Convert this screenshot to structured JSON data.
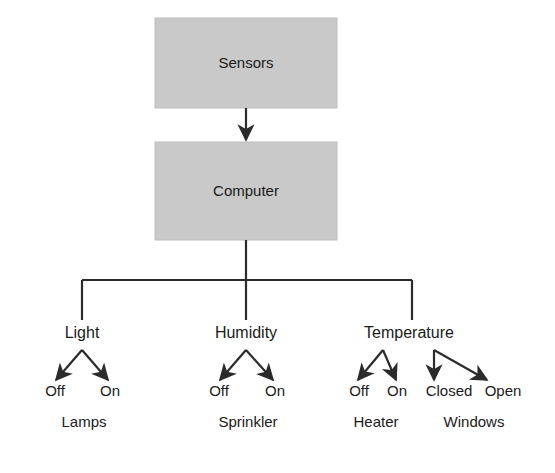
{
  "diagram": {
    "type": "flowchart",
    "background_color": "#ffffff",
    "box_fill_color": "#c9c9c9",
    "line_color": "#2b2b2b",
    "text_color": "#1a1a1a",
    "boxes": [
      {
        "id": "sensors",
        "label": "Sensors",
        "x": 155,
        "y": 18,
        "width": 182,
        "height": 90
      },
      {
        "id": "computer",
        "label": "Computer",
        "x": 155,
        "y": 142,
        "width": 182,
        "height": 98
      }
    ],
    "main_arrow": {
      "from": "sensors",
      "to": "computer",
      "x": 246,
      "y_start": 108,
      "y_end": 140
    },
    "bus": {
      "stem_x": 246,
      "stem_y_start": 240,
      "bus_y": 280,
      "left_x": 82,
      "right_x": 412,
      "drop_y_end": 320
    },
    "branches": [
      {
        "id": "light",
        "label": "Light",
        "label_x": 82,
        "label_y": 338,
        "apex_x": 82,
        "apex_y": 350,
        "states": [
          {
            "label": "Off",
            "x": 55,
            "y": 396
          },
          {
            "label": "On",
            "x": 110,
            "y": 396
          }
        ],
        "devices": [
          {
            "label": "Lamps",
            "x": 84,
            "y": 427
          }
        ]
      },
      {
        "id": "humidity",
        "label": "Humidity",
        "label_x": 246,
        "label_y": 338,
        "apex_x": 246,
        "apex_y": 350,
        "states": [
          {
            "label": "Off",
            "x": 219,
            "y": 396
          },
          {
            "label": "On",
            "x": 275,
            "y": 396
          }
        ],
        "devices": [
          {
            "label": "Sprinkler",
            "x": 248,
            "y": 427
          }
        ]
      },
      {
        "id": "temperature",
        "label": "Temperature",
        "label_x": 409,
        "label_y": 338,
        "apex_x": 409,
        "apex_y": 350,
        "states": [
          {
            "label": "Off",
            "x": 359,
            "y": 396
          },
          {
            "label": "On",
            "x": 397,
            "y": 396
          },
          {
            "label": "Closed",
            "x": 449,
            "y": 396
          },
          {
            "label": "Open",
            "x": 503,
            "y": 396
          }
        ],
        "devices": [
          {
            "label": "Heater",
            "x": 376,
            "y": 427
          },
          {
            "label": "Windows",
            "x": 474,
            "y": 427
          }
        ]
      }
    ],
    "branch_arrows": [
      {
        "branch": "light",
        "x1": 82,
        "y1": 350,
        "x2": 56,
        "y2": 380
      },
      {
        "branch": "light",
        "x1": 82,
        "y1": 350,
        "x2": 108,
        "y2": 380
      },
      {
        "branch": "humidity",
        "x1": 246,
        "y1": 350,
        "x2": 220,
        "y2": 380
      },
      {
        "branch": "humidity",
        "x1": 246,
        "y1": 350,
        "x2": 273,
        "y2": 380
      },
      {
        "branch": "temperature",
        "x1": 383,
        "y1": 350,
        "x2": 358,
        "y2": 380
      },
      {
        "branch": "temperature",
        "x1": 383,
        "y1": 350,
        "x2": 396,
        "y2": 380
      },
      {
        "branch": "temperature",
        "x1": 434,
        "y1": 350,
        "x2": 434,
        "y2": 380
      },
      {
        "branch": "temperature",
        "x1": 434,
        "y1": 350,
        "x2": 487,
        "y2": 380
      }
    ]
  }
}
